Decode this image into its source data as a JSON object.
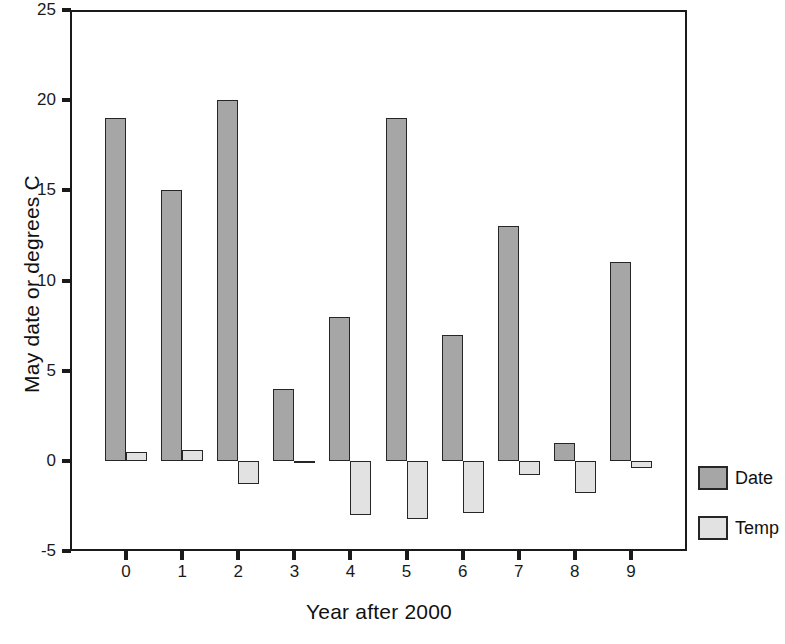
{
  "chart_data": {
    "type": "bar",
    "title": "",
    "xlabel": "Year after 2000",
    "ylabel": "May date or degrees C",
    "categories": [
      "0",
      "1",
      "2",
      "3",
      "4",
      "5",
      "6",
      "7",
      "8",
      "9"
    ],
    "series": [
      {
        "name": "Date",
        "color": "#a6a6a6",
        "values": [
          19,
          15,
          20,
          4,
          8,
          19,
          7,
          13,
          1,
          11
        ]
      },
      {
        "name": "Temp",
        "color": "#e2e2e2",
        "values": [
          0.5,
          0.6,
          -1.3,
          -0.1,
          -3.0,
          -3.2,
          -2.9,
          -0.8,
          -1.8,
          -0.4
        ]
      }
    ],
    "ylim": [
      -5,
      25
    ],
    "yticks": [
      25,
      20,
      15,
      10,
      5,
      0,
      -5
    ],
    "ytick_labels": [
      "25",
      "20",
      "15",
      "10",
      "5",
      "0",
      "-5"
    ],
    "xticks": [
      0,
      1,
      2,
      3,
      4,
      5,
      6,
      7,
      8,
      9
    ],
    "grid": false,
    "legend_position": "right",
    "legend_entries": [
      "Date",
      "Temp"
    ],
    "bar_border_color": "#262626",
    "frame_color": "#1a1a1a",
    "background": "#ffffff"
  }
}
